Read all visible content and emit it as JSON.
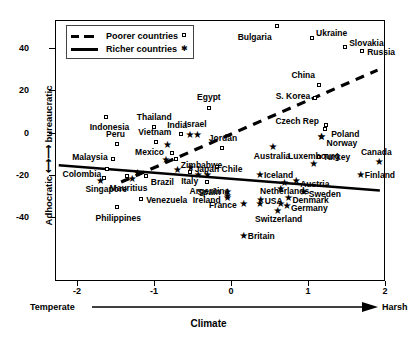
{
  "chart_data": {
    "type": "scatter",
    "title": "",
    "xlabel": "Climate",
    "ylabel": "Adhocratic <-> bureaucratic",
    "xlim": [
      -2.25,
      2.0
    ],
    "ylim": [
      -51,
      54
    ],
    "xticks": [
      -2,
      -1,
      0,
      1,
      2
    ],
    "yticks": [
      40,
      20,
      0,
      -20,
      -40
    ],
    "xaxis_left_end_label": "Temperate",
    "xaxis_right_end_label": "Harsh",
    "grid": false,
    "legend_position": "top-left",
    "legend": [
      {
        "label": "Poorer countries",
        "marker": "square",
        "line": "dashed"
      },
      {
        "label": "Richer countries",
        "marker": "star",
        "line": "solid"
      }
    ],
    "series": [
      {
        "name": "Poorer countries",
        "marker": "square",
        "points": [
          {
            "label": "Bulgaria",
            "x": 0.58,
            "y": 51,
            "lx": -5,
            "ly": 11,
            "anchor": "r"
          },
          {
            "label": "Ukraine",
            "x": 1.04,
            "y": 45,
            "lx": 4,
            "ly": -5,
            "anchor": "l"
          },
          {
            "label": "Slovakia",
            "x": 1.47,
            "y": 41,
            "lx": 4,
            "ly": -4,
            "anchor": "l"
          },
          {
            "label": "Russia",
            "x": 1.69,
            "y": 39,
            "lx": 5,
            "ly": 1,
            "anchor": "l"
          },
          {
            "label": "China",
            "x": 1.13,
            "y": 23,
            "lx": -4,
            "ly": -10,
            "anchor": "r"
          },
          {
            "label": "S. Korea",
            "x": 1.08,
            "y": 17,
            "lx": -5,
            "ly": -2,
            "anchor": "r"
          },
          {
            "label": "Egypt",
            "x": -0.3,
            "y": 12,
            "lx": 0,
            "ly": -11,
            "anchor": "c"
          },
          {
            "label": "Czech Rep",
            "x": 1.22,
            "y": 4,
            "lx": -7,
            "ly": -4,
            "anchor": "r"
          },
          {
            "label": "Poland",
            "x": 1.21,
            "y": 2,
            "lx": 6,
            "ly": 5,
            "anchor": "l"
          },
          {
            "label": "Indonesia",
            "x": -1.63,
            "y": 8,
            "lx": 3,
            "ly": 10,
            "anchor": "c"
          },
          {
            "label": "Thailand",
            "x": -1.01,
            "y": 3,
            "lx": 0,
            "ly": -10,
            "anchor": "c"
          },
          {
            "label": "India",
            "x": -0.66,
            "y": 0,
            "lx": -4,
            "ly": -9,
            "anchor": "c"
          },
          {
            "label": "Peru",
            "x": -1.5,
            "y": -5,
            "lx": -1,
            "ly": -10,
            "anchor": "c"
          },
          {
            "label": "Vietnam",
            "x": -0.99,
            "y": -4,
            "lx": -1,
            "ly": -10,
            "anchor": "c"
          },
          {
            "label": "Jordan",
            "x": -0.13,
            "y": -7,
            "lx": 1,
            "ly": -10,
            "anchor": "c"
          },
          {
            "label": "Mexico",
            "x": -0.78,
            "y": -9,
            "lx": -8,
            "ly": -1,
            "anchor": "r"
          },
          {
            "label": "Malaysia",
            "x": -1.55,
            "y": -12,
            "lx": -5,
            "ly": -2,
            "anchor": "r"
          },
          {
            "label": "Zimbabwe",
            "x": -0.73,
            "y": -12,
            "lx": 5,
            "ly": 6,
            "anchor": "l"
          },
          {
            "label": "Turkey",
            "x": 1.13,
            "y": -11,
            "lx": 4,
            "ly": 0,
            "anchor": "l"
          },
          {
            "label": "Colombia",
            "x": -1.62,
            "y": -17,
            "lx": -6,
            "ly": 5,
            "anchor": "r"
          },
          {
            "label": "Chile",
            "x": -0.2,
            "y": -16,
            "lx": 5,
            "ly": 2,
            "anchor": "l"
          },
          {
            "label": "Brazil",
            "x": -1.12,
            "y": -20,
            "lx": 5,
            "ly": 6,
            "anchor": "l"
          },
          {
            "label": "Italy",
            "x": -0.55,
            "y": -18,
            "lx": 0,
            "ly": 9,
            "anchor": "c"
          },
          {
            "label": "Singapore",
            "x": -1.66,
            "y": -21,
            "lx": 2,
            "ly": 11,
            "anchor": "c"
          },
          {
            "label": "Mauritius",
            "x": -1.37,
            "y": -20,
            "lx": 2,
            "ly": 12,
            "anchor": "c"
          },
          {
            "label": "Argentina",
            "x": -0.32,
            "y": -23,
            "lx": 2,
            "ly": 9,
            "anchor": "c"
          },
          {
            "label": "Venezuela",
            "x": -1.18,
            "y": -31,
            "lx": 5,
            "ly": 1,
            "anchor": "l"
          },
          {
            "label": "Philippines",
            "x": -1.49,
            "y": -35,
            "lx": 1,
            "ly": 11,
            "anchor": "c"
          }
        ]
      },
      {
        "name": "Richer countries",
        "marker": "star",
        "points": [
          {
            "label": "Israel",
            "x": -0.46,
            "y": 0,
            "lx": -1,
            "ly": -10,
            "anchor": "c"
          },
          {
            "label": "Norway",
            "x": 1.15,
            "y": -1,
            "lx": 6,
            "ly": 7,
            "anchor": "l"
          },
          {
            "label": "Australia",
            "x": 0.52,
            "y": -6,
            "lx": 0,
            "ly": 10,
            "anchor": "c"
          },
          {
            "label": "Canada",
            "x": 1.9,
            "y": -13,
            "lx": -2,
            "ly": -9,
            "anchor": "c"
          },
          {
            "label": "Luxembourg",
            "x": 1.05,
            "y": -14,
            "lx": 1,
            "ly": -7,
            "anchor": "c"
          },
          {
            "label": "Japan",
            "x": -0.55,
            "y": -16,
            "lx": 5,
            "ly": 2,
            "anchor": "l"
          },
          {
            "label": "Iceland",
            "x": 0.35,
            "y": -19,
            "lx": 5,
            "ly": 1,
            "anchor": "l"
          },
          {
            "label": "Finland",
            "x": 1.66,
            "y": -19,
            "lx": 5,
            "ly": 1,
            "anchor": "l"
          },
          {
            "label": "Austria",
            "x": 0.82,
            "y": -22,
            "lx": 5,
            "ly": 4,
            "anchor": "l"
          },
          {
            "label": "Netherlands",
            "x": 0.67,
            "y": -23,
            "lx": 1,
            "ly": 9,
            "anchor": "c"
          },
          {
            "label": "Sweden",
            "x": 0.92,
            "y": -27,
            "lx": 6,
            "ly": 3,
            "anchor": "l"
          },
          {
            "label": "Spain",
            "x": -0.07,
            "y": -27,
            "lx": -6,
            "ly": 1,
            "anchor": "r"
          },
          {
            "label": "Ireland",
            "x": -0.07,
            "y": -30,
            "lx": -6,
            "ly": 3,
            "anchor": "r"
          },
          {
            "label": "USA",
            "x": 0.36,
            "y": -31,
            "lx": 5,
            "ly": 2,
            "anchor": "l"
          },
          {
            "label": "Denmark",
            "x": 0.72,
            "y": -30,
            "lx": 5,
            "ly": 3,
            "anchor": "l"
          },
          {
            "label": "France",
            "x": 0.14,
            "y": -33,
            "lx": -6,
            "ly": 2,
            "anchor": "r"
          },
          {
            "label": "Germany",
            "x": 0.7,
            "y": -34,
            "lx": 5,
            "ly": 3,
            "anchor": "l"
          },
          {
            "label": "Switzerland",
            "x": 0.58,
            "y": -36,
            "lx": 2,
            "ly": 9,
            "anchor": "c"
          },
          {
            "label": "Britain",
            "x": 0.14,
            "y": -48,
            "lx": 5,
            "ly": 1,
            "anchor": "l"
          },
          {
            "label": "Colombia-s",
            "x": -1.72,
            "y": -22,
            "lx": 0,
            "ly": 0,
            "anchor": "none"
          },
          {
            "label": "Mauritius-s",
            "x": -1.31,
            "y": -21,
            "lx": 0,
            "ly": 0,
            "anchor": "none"
          },
          {
            "label": "Japan-s2",
            "x": -0.72,
            "y": -17,
            "lx": 0,
            "ly": 0,
            "anchor": "none"
          },
          {
            "label": "Italy-s",
            "x": -0.45,
            "y": -19,
            "lx": 0,
            "ly": 0,
            "anchor": "none"
          },
          {
            "label": "Brazil-s",
            "x": -1.24,
            "y": -18,
            "lx": 0,
            "ly": 0,
            "anchor": "none"
          },
          {
            "label": "India-s",
            "x": -0.56,
            "y": 0,
            "lx": 0,
            "ly": 0,
            "anchor": "none"
          },
          {
            "label": "Poland-s",
            "x": 1.15,
            "y": -1,
            "lx": 0,
            "ly": 0,
            "anchor": "none"
          },
          {
            "label": "Vietnam-s",
            "x": -0.85,
            "y": -5,
            "lx": 0,
            "ly": 0,
            "anchor": "none"
          },
          {
            "label": "Mexico-s",
            "x": -0.87,
            "y": -12,
            "lx": 0,
            "ly": 0,
            "anchor": "none"
          },
          {
            "label": "Japan-s3",
            "x": -0.33,
            "y": -19,
            "lx": 0,
            "ly": 0,
            "anchor": "none"
          },
          {
            "label": "Spain-s2",
            "x": -0.07,
            "y": -29,
            "lx": 0,
            "ly": 0,
            "anchor": "none"
          },
          {
            "label": "France-s2",
            "x": 0.35,
            "y": -33,
            "lx": 0,
            "ly": 0,
            "anchor": "none"
          },
          {
            "label": "Germ-s2",
            "x": 0.62,
            "y": -33,
            "lx": 0,
            "ly": 0,
            "anchor": "none"
          },
          {
            "label": "Neth-s2",
            "x": 0.62,
            "y": -26,
            "lx": 0,
            "ly": 0,
            "anchor": "none"
          }
        ]
      }
    ],
    "trend_lines": [
      {
        "name": "Poorer countries",
        "style": "dashed",
        "x1": -1.44,
        "y1": -23,
        "x2": 1.89,
        "y2": 30
      },
      {
        "name": "Richer countries",
        "style": "solid",
        "x1": -2.25,
        "y1": -15,
        "x2": 1.92,
        "y2": -27
      }
    ]
  }
}
